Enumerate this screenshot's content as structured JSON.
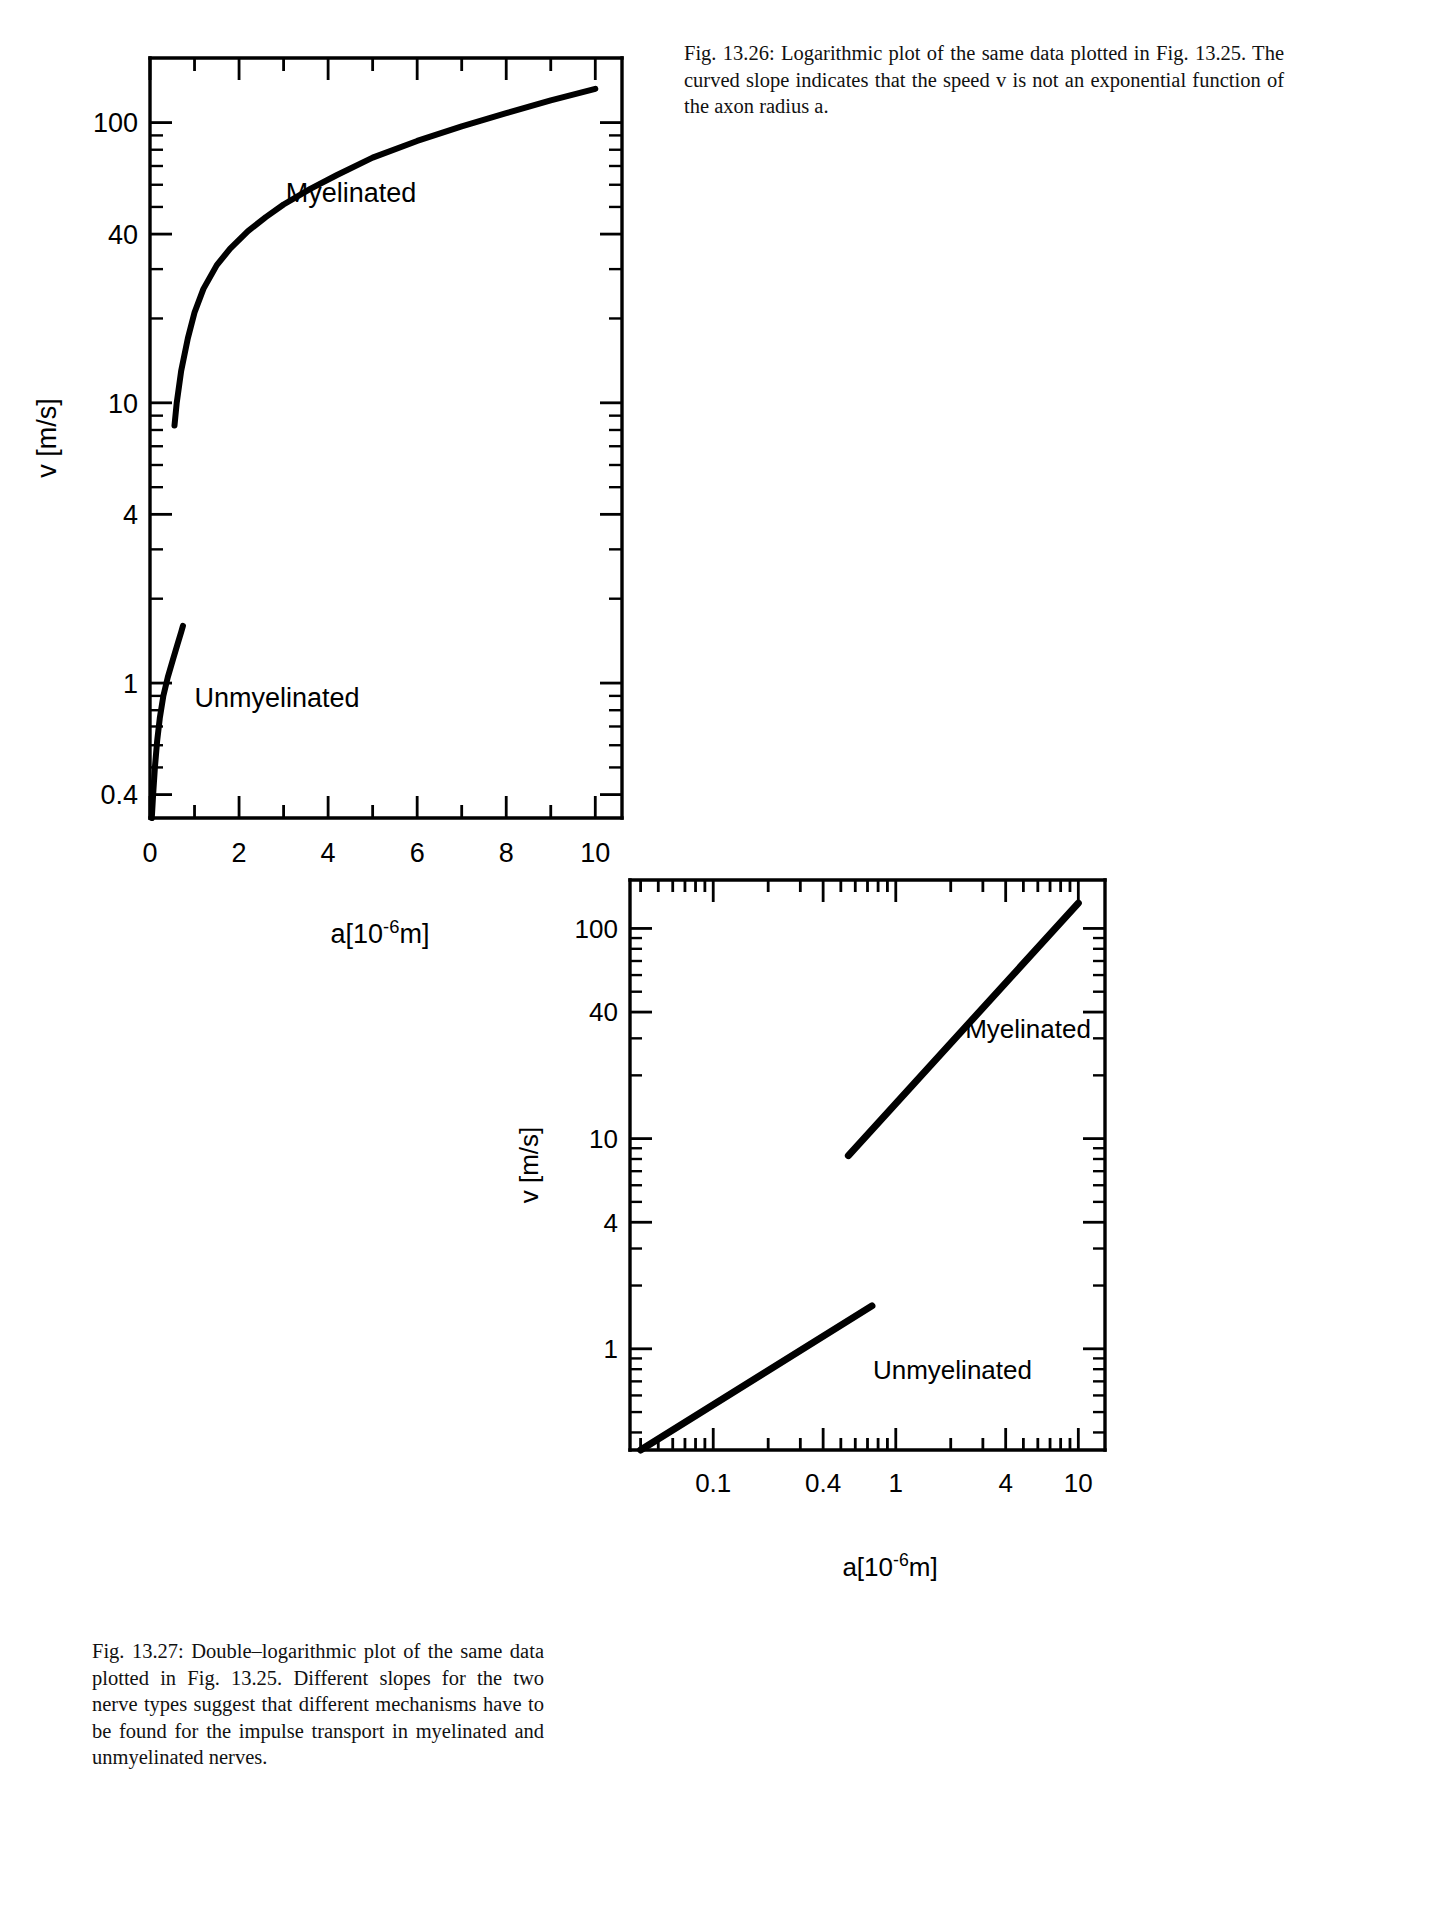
{
  "page": {
    "background": "#ffffff",
    "ink": "#000000"
  },
  "figures": [
    {
      "id": "fig-13-26",
      "caption": "Fig. 13.26: Logarithmic plot of the same data plotted in Fig. 13.25. The curved slope indicates that the speed v is not an exponential function of the axon radius a.",
      "caption_lines": [
        "Fig. 13.26: Logarithmic plot of the same data plotted",
        "in Fig. 13.25. The curved slope indicates that the",
        "speed v is not an exponential function of the axon",
        "radius a."
      ]
    },
    {
      "id": "fig-13-27",
      "caption": "Fig. 13.27: Double–logarithmic plot of the same data plotted in Fig. 13.25. Different slopes for the two nerve types suggest that different mechanisms have to be found for the impulse transport in myelinated and unmyelinated nerves.",
      "caption_lines": [
        "Fig. 13.27: Double–logarithmic plot of the",
        "same data plotted in Fig. 13.25. Different",
        "slopes for the two nerve types suggest that",
        "different mechanisms have to be found for the",
        "impulse transport in myelinated and unmy-",
        "elinated nerves."
      ]
    }
  ],
  "chart_data": [
    {
      "id": "chart-13-26",
      "type": "line",
      "title": "",
      "xlabel": "a[10-6m]",
      "xlabel_parts": {
        "base": "a[10",
        "exp": "-6",
        "tail": "m]"
      },
      "ylabel": "v [m/s]",
      "xscale": "linear",
      "yscale": "log",
      "xlim": [
        0,
        10.6
      ],
      "ylim": [
        0.33,
        170
      ],
      "xticks": [
        0,
        2,
        4,
        6,
        8,
        10
      ],
      "xticklabels": [
        "0",
        "2",
        "4",
        "6",
        "8",
        "10"
      ],
      "x_minor_step": 1,
      "yticks": [
        0.4,
        1,
        4,
        10,
        40,
        100
      ],
      "yticklabels": [
        "0.4",
        "1",
        "4",
        "10",
        "40",
        "100"
      ],
      "grid": false,
      "legend": "inline-annotations",
      "series": [
        {
          "name": "Myelinated",
          "label_x": 3.05,
          "label_y": 52,
          "points": [
            [
              0.55,
              8.3
            ],
            [
              0.6,
              10.0
            ],
            [
              0.7,
              13.0
            ],
            [
              0.85,
              17.0
            ],
            [
              1.0,
              21.0
            ],
            [
              1.2,
              25.5
            ],
            [
              1.5,
              31.0
            ],
            [
              1.8,
              35.5
            ],
            [
              2.2,
              41.0
            ],
            [
              2.6,
              46.0
            ],
            [
              3.0,
              51.0
            ],
            [
              3.6,
              58.0
            ],
            [
              4.2,
              65.0
            ],
            [
              5.0,
              75.0
            ],
            [
              6.0,
              86.0
            ],
            [
              7.0,
              97.0
            ],
            [
              8.0,
              108.0
            ],
            [
              9.0,
              120.0
            ],
            [
              10.0,
              132.0
            ]
          ]
        },
        {
          "name": "Unmyelinated",
          "label_x": 1.0,
          "label_y": 0.82,
          "points": [
            [
              0.04,
              0.33
            ],
            [
              0.07,
              0.4
            ],
            [
              0.11,
              0.5
            ],
            [
              0.16,
              0.62
            ],
            [
              0.22,
              0.75
            ],
            [
              0.3,
              0.9
            ],
            [
              0.4,
              1.05
            ],
            [
              0.52,
              1.22
            ],
            [
              0.62,
              1.38
            ],
            [
              0.7,
              1.52
            ],
            [
              0.74,
              1.6
            ]
          ]
        }
      ]
    },
    {
      "id": "chart-13-27",
      "type": "line",
      "title": "",
      "xlabel": "a[10-6m]",
      "xlabel_parts": {
        "base": "a[10",
        "exp": "-6",
        "tail": "m]"
      },
      "ylabel": "v [m/s]",
      "xscale": "log",
      "yscale": "log",
      "xlim": [
        0.035,
        14
      ],
      "ylim": [
        0.33,
        170
      ],
      "xticks": [
        0.1,
        0.4,
        1,
        4,
        10
      ],
      "xticklabels": [
        "0.1",
        "0.4",
        "1",
        "4",
        "10"
      ],
      "yticks": [
        1,
        4,
        10,
        40,
        100
      ],
      "yticklabels": [
        "1",
        "4",
        "10",
        "40",
        "100"
      ],
      "grid": false,
      "legend": "inline-annotations",
      "series": [
        {
          "name": "Myelinated",
          "label_x": 2.4,
          "label_y": 30,
          "points": [
            [
              0.55,
              8.3
            ],
            [
              10.0,
              132.0
            ]
          ]
        },
        {
          "name": "Unmyelinated",
          "label_x": 0.75,
          "label_y": 0.72,
          "points": [
            [
              0.04,
              0.33
            ],
            [
              0.74,
              1.6
            ]
          ]
        }
      ]
    }
  ]
}
